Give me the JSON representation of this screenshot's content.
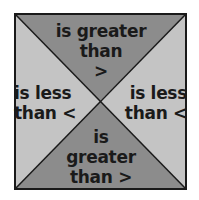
{
  "diagram": {
    "colors": {
      "dark_triangle": "#8c8c8c",
      "light_triangle": "#c4c4c4",
      "border": "#1a1a1a",
      "text": "#1a1a1a"
    },
    "triangles": {
      "top": {
        "lines": [
          "is greater",
          "than",
          ">"
        ]
      },
      "left": {
        "lines": [
          "is less",
          "than <"
        ]
      },
      "right": {
        "lines": [
          "is less",
          "than <"
        ]
      },
      "bottom": {
        "lines": [
          "is",
          "greater",
          "than >"
        ]
      }
    }
  }
}
